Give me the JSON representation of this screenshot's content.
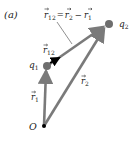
{
  "figure": {
    "panel_label": "(a)",
    "equation": {
      "lhs": "r",
      "lhs_sub": "12",
      "eq": "=",
      "term1": "r",
      "term1_sub": "2",
      "minus": "−",
      "term2": "r",
      "term2_sub": "1"
    },
    "points": {
      "origin": {
        "label": "O"
      },
      "q1": {
        "label": "q",
        "sub": "1"
      },
      "q2": {
        "label": "q",
        "sub": "2"
      }
    },
    "vectors": {
      "r1": {
        "label": "r",
        "sub": "1"
      },
      "r2": {
        "label": "r",
        "sub": "2"
      },
      "r12": {
        "label": "r",
        "sub": "12"
      }
    },
    "colors": {
      "vector": "#7a7a7a",
      "charge": "#6e6e6e",
      "unit_arrow": "#000000",
      "text": "#222222"
    }
  }
}
